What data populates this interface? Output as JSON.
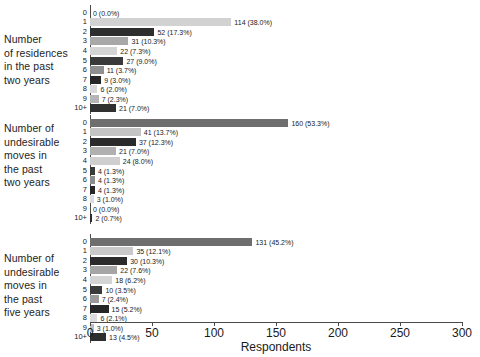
{
  "chart_data": {
    "type": "bar",
    "orientation": "horizontal",
    "title": "",
    "xlabel": "Respondents",
    "ylabel": "",
    "xlim": [
      0,
      300
    ],
    "xticks": [
      0,
      50,
      100,
      150,
      200,
      250,
      300
    ],
    "grid": false,
    "legend": "none",
    "categories": [
      "0",
      "1",
      "2",
      "3",
      "4",
      "5",
      "6",
      "7",
      "8",
      "9",
      "10+"
    ],
    "groups": [
      {
        "label_lines": [
          "Number",
          "of residences",
          "in the past",
          "two years"
        ],
        "values": [
          0,
          114,
          52,
          31,
          22,
          27,
          11,
          9,
          6,
          7,
          21
        ],
        "percents": [
          "0.0%",
          "38.0%",
          "17.3%",
          "10.3%",
          "7.3%",
          "9.0%",
          "3.7%",
          "3.0%",
          "2.0%",
          "2.3%",
          "7.0%"
        ],
        "labels": [
          "0 (0.0%)",
          "114 (38.0%)",
          "52 (17.3%)",
          "31 (10.3%)",
          "22 (7.3%)",
          "27 (9.0%)",
          "11 (3.7%)",
          "9 (3.0%)",
          "6 (2.0%)",
          "7 (2.3%)",
          "21 (7.0%)"
        ],
        "colors": [
          "#c9c9c9",
          "#d2d2d2",
          "#2e2e2e",
          "#a8a8a8",
          "#d4d4d4",
          "#3a3a3a",
          "#8f8f8f",
          "#262626",
          "#d9d9d9",
          "#b5b5b5",
          "#303030"
        ]
      },
      {
        "label_lines": [
          "Number of",
          "undesirable",
          "moves in",
          "the past",
          "two years"
        ],
        "values": [
          160,
          41,
          37,
          21,
          24,
          4,
          4,
          4,
          3,
          0,
          2
        ],
        "percents": [
          "53.3%",
          "13.7%",
          "12.3%",
          "7.0%",
          "8.0%",
          "1.3%",
          "1.3%",
          "1.3%",
          "1.0%",
          "0.0%",
          "0.7%"
        ],
        "labels": [
          "160 (53.3%)",
          "41 (13.7%)",
          "37 (12.3%)",
          "21 (7.0%)",
          "24 (8.0%)",
          "4 (1.3%)",
          "4 (1.3%)",
          "4 (1.3%)",
          "3 (1.0%)",
          "0 (0.0%)",
          "2 (0.7%)"
        ],
        "colors": [
          "#6e6e6e",
          "#c4c4c4",
          "#2b2b2b",
          "#b0b0b0",
          "#cfcfcf",
          "#3a3a3a",
          "#8c8c8c",
          "#262626",
          "#dcdcdc",
          "#bdbdbd",
          "#2e2e2e"
        ]
      },
      {
        "label_lines": [
          "Number of",
          "undesirable",
          "moves in",
          "the past",
          "five years"
        ],
        "values": [
          131,
          35,
          30,
          22,
          18,
          10,
          7,
          15,
          6,
          3,
          13
        ],
        "percents": [
          "45.2%",
          "12.1%",
          "10.3%",
          "7.6%",
          "6.2%",
          "3.5%",
          "2.4%",
          "5.2%",
          "2.1%",
          "1.0%",
          "4.5%"
        ],
        "labels": [
          "131 (45.2%)",
          "35 (12.1%)",
          "30 (10.3%)",
          "22 (7.6%)",
          "18 (6.2%)",
          "10 (3.5%)",
          "7 (2.4%)",
          "15 (5.2%)",
          "6 (2.1%)",
          "3 (1.0%)",
          "13 (4.5%)"
        ],
        "colors": [
          "#6e6e6e",
          "#c9c9c9",
          "#2b2b2b",
          "#a5a5a5",
          "#d4d4d4",
          "#3a3a3a",
          "#9a9a9a",
          "#262626",
          "#dcdcdc",
          "#bdbdbd",
          "#2e2e2e"
        ]
      }
    ]
  },
  "axis": {
    "x_title": "Respondents",
    "tick_labels": [
      "0",
      "50",
      "100",
      "150",
      "200",
      "250",
      "300"
    ]
  }
}
